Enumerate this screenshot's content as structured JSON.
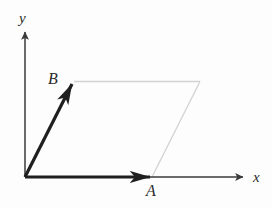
{
  "figure": {
    "background_color": "#fdfdfd",
    "axes": {
      "x_axis_label": "x",
      "y_axis_label": "y",
      "origin_label": "",
      "axis_color": "#3a3a3a"
    },
    "vectors": [
      {
        "name": "A",
        "label": "A",
        "color": "#1f1f1f",
        "from": [
          25,
          177
        ],
        "to": [
          152,
          177
        ],
        "label_position": [
          146,
          196
        ]
      },
      {
        "name": "B",
        "label": "B",
        "color": "#1f1f1f",
        "from": [
          25,
          177
        ],
        "to": [
          74,
          81
        ],
        "label_position": [
          48,
          84
        ]
      }
    ],
    "parallelogram": {
      "name": "sum-parallelogram",
      "color": "#d0d0d0",
      "vertices": [
        [
          25,
          177
        ],
        [
          152,
          177
        ],
        [
          200,
          81
        ],
        [
          74,
          81
        ]
      ],
      "construction_edges": [
        {
          "from": [
            74,
            81
          ],
          "to": [
            200,
            81
          ]
        },
        {
          "from": [
            200,
            81
          ],
          "to": [
            152,
            177
          ]
        }
      ]
    },
    "geometry": {
      "origin": [
        25,
        177
      ],
      "x_axis_tip": [
        246,
        177
      ],
      "y_axis_tip": [
        25,
        29
      ]
    }
  }
}
